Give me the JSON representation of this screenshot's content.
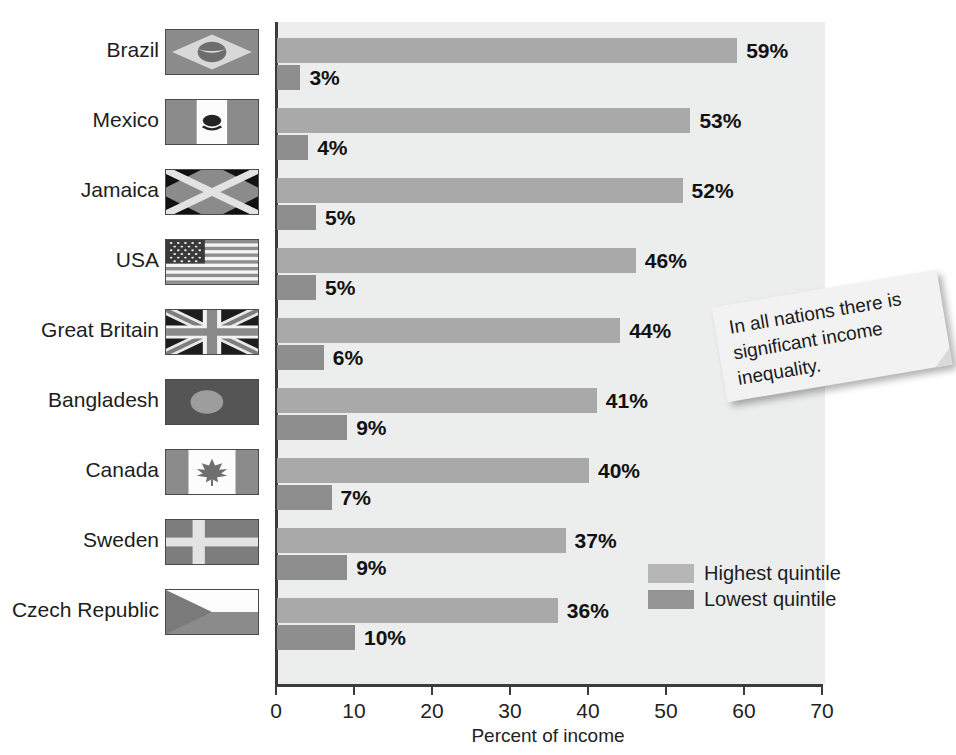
{
  "chart_data": {
    "type": "bar",
    "orientation": "horizontal",
    "title": "",
    "xlabel": "Percent of income",
    "ylabel": "",
    "xlim": [
      0,
      70
    ],
    "xticks": [
      0,
      10,
      20,
      30,
      40,
      50,
      60,
      70
    ],
    "xtick_labels": [
      "0",
      "10",
      "20",
      "30",
      "40",
      "50",
      "60",
      "70"
    ],
    "grid": false,
    "legend_position": "inside-bottom-right",
    "categories": [
      "Brazil",
      "Mexico",
      "Jamaica",
      "USA",
      "Great Britain",
      "Bangladesh",
      "Canada",
      "Sweden",
      "Czech Republic"
    ],
    "series": [
      {
        "name": "Highest quintile",
        "color": "#a9a9a9",
        "values": [
          59,
          53,
          52,
          46,
          44,
          41,
          40,
          37,
          36
        ],
        "labels": [
          "59%",
          "53%",
          "52%",
          "46%",
          "44%",
          "41%",
          "40%",
          "37%",
          "36%"
        ]
      },
      {
        "name": "Lowest quintile",
        "color": "#8e8e8e",
        "values": [
          3,
          4,
          5,
          5,
          6,
          9,
          7,
          9,
          10
        ],
        "labels": [
          "3%",
          "4%",
          "5%",
          "5%",
          "6%",
          "9%",
          "7%",
          "9%",
          "10%"
        ]
      }
    ],
    "annotations": [
      {
        "text": "In all nations there is significant income inequality."
      }
    ]
  },
  "rows": [
    {
      "country": "Brazil",
      "flag": "flag-brazil",
      "high": 59,
      "low": 3,
      "high_label": "59%",
      "low_label": "3%"
    },
    {
      "country": "Mexico",
      "flag": "flag-mexico",
      "high": 53,
      "low": 4,
      "high_label": "53%",
      "low_label": "4%"
    },
    {
      "country": "Jamaica",
      "flag": "flag-jamaica",
      "high": 52,
      "low": 5,
      "high_label": "52%",
      "low_label": "5%"
    },
    {
      "country": "USA",
      "flag": "flag-usa",
      "high": 46,
      "low": 5,
      "high_label": "46%",
      "low_label": "5%"
    },
    {
      "country": "Great Britain",
      "flag": "flag-great-britain",
      "high": 44,
      "low": 6,
      "high_label": "44%",
      "low_label": "6%"
    },
    {
      "country": "Bangladesh",
      "flag": "flag-bangladesh",
      "high": 41,
      "low": 9,
      "high_label": "41%",
      "low_label": "9%"
    },
    {
      "country": "Canada",
      "flag": "flag-canada",
      "high": 40,
      "low": 7,
      "high_label": "40%",
      "low_label": "7%"
    },
    {
      "country": "Sweden",
      "flag": "flag-sweden",
      "high": 37,
      "low": 9,
      "high_label": "37%",
      "low_label": "9%"
    },
    {
      "country": "Czech Republic",
      "flag": "flag-czech-republic",
      "high": 36,
      "low": 10,
      "high_label": "36%",
      "low_label": "10%"
    }
  ],
  "axis": {
    "ticks": [
      "0",
      "10",
      "20",
      "30",
      "40",
      "50",
      "60",
      "70"
    ],
    "title": "Percent of income"
  },
  "legend": {
    "highest": "Highest quintile",
    "lowest": "Lowest quintile"
  },
  "callout": {
    "text": "In all nations there is significant income inequality."
  },
  "colors": {
    "highest_quintile": "#a9a9a9",
    "lowest_quintile": "#8e8e8e",
    "plot_background": "#eceded",
    "axis": "#3b3b3b",
    "text": "#1a1a1a"
  }
}
